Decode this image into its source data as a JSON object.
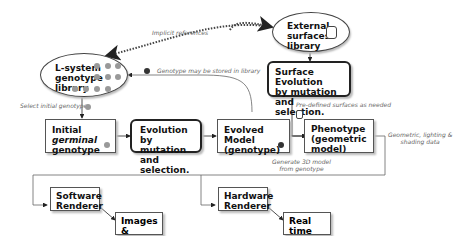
{
  "nodes": {
    "lsystem_library": {
      "line1": "L-system",
      "line2": "genotype",
      "line3": "library"
    },
    "external_surfaces": {
      "line1": "External",
      "line2": "surfaces",
      "line3": "library"
    },
    "surface_evolution": {
      "line1": "Surface Evolution",
      "line2": "by mutation and",
      "line3": "selection."
    },
    "initial_genotype": {
      "line1_a": "Initial ",
      "line1_b": "germinal",
      "line2": "genotype"
    },
    "evolution": {
      "line1": "Evolution by",
      "line2": "mutation and",
      "line3": "selection."
    },
    "evolved_model": {
      "line1": "Evolved Model",
      "line2": "(genotype)"
    },
    "phenotype": {
      "line1": "Phenotype",
      "line2": "(geometric",
      "line3": "model)"
    },
    "software_renderer": {
      "line1": "Software",
      "line2": "Renderer"
    },
    "images_animation": {
      "line1": "Images &",
      "line2": "Animation"
    },
    "hardware_renderer": {
      "line1": "Hardware",
      "line2": "Renderer"
    },
    "realtime_display": {
      "line1": "Real time",
      "line2": "display"
    }
  },
  "annotations": {
    "implicit_references": "Implicit references",
    "genotype_stored": "Genotype may be stored in library",
    "select_initial": "Select initial genotype",
    "predefined_surfaces": "Pre-defined surfaces as needed",
    "geometric_data_1": "Geometric, lighting &",
    "geometric_data_2": "shading data",
    "generate_3d_1": "Generate 3D model",
    "generate_3d_2": "from genotype"
  }
}
